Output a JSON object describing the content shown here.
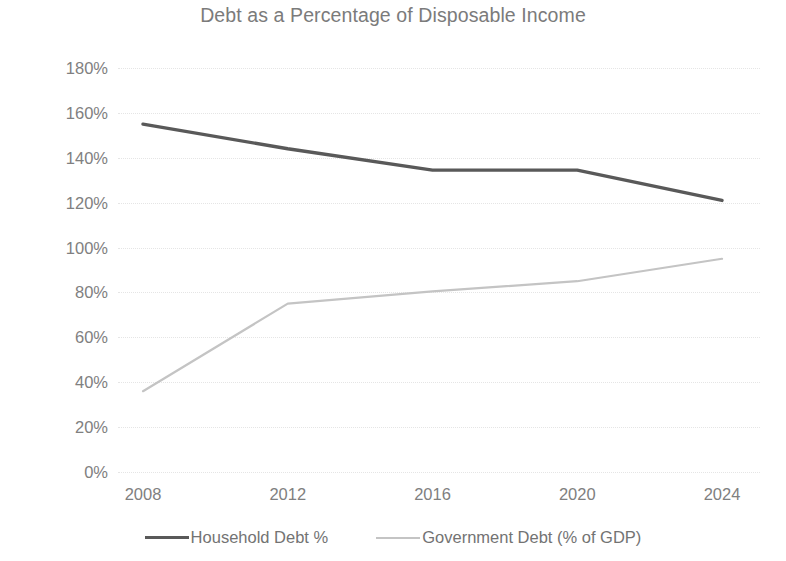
{
  "chart_data": {
    "type": "line",
    "title": "Debt as a Percentage of Disposable Income",
    "xlabel": "",
    "ylabel": "",
    "x": [
      2008,
      2012,
      2016,
      2020,
      2024
    ],
    "categories": [
      "2008",
      "2012",
      "2016",
      "2020",
      "2024"
    ],
    "ylim": [
      0,
      180
    ],
    "ytick_labels": [
      "180%",
      "160%",
      "140%",
      "120%",
      "100%",
      "80%",
      "60%",
      "40%",
      "20%",
      "0%"
    ],
    "ytick_values": [
      180,
      160,
      140,
      120,
      100,
      80,
      60,
      40,
      20,
      0
    ],
    "grid": true,
    "grid_orientation": "horizontal",
    "legend_position": "bottom",
    "series": [
      {
        "name": "Household Debt %",
        "values": [
          155,
          144,
          134.5,
          134.5,
          121
        ],
        "color": "#595959",
        "line_width": 3.4
      },
      {
        "name": "Government Debt (% of GDP)",
        "values": [
          36,
          75,
          80.5,
          85,
          95
        ],
        "color": "#c4c4c4",
        "line_width": 2.2
      }
    ]
  },
  "colors": {
    "background": "#ffffff",
    "title_text": "#7b7b7b",
    "tick_text": "#808080",
    "legend_text": "#737373",
    "gridline": "#e4e4e4",
    "series_household": "#595959",
    "series_government": "#c4c4c4"
  }
}
